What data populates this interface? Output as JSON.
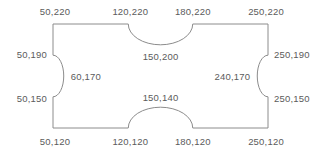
{
  "diagram": {
    "type": "coordinate-outline",
    "stroke_color": "#8c8c8c",
    "text_color": "#5b5b5b",
    "background_color": "#ffffff",
    "outline": {
      "rect_x_min": 50,
      "rect_x_max": 250,
      "rect_y_min": 120,
      "rect_y_max": 220
    },
    "labels": [
      {
        "id": "top-left-corner",
        "text": "50,220",
        "x": 50,
        "y": 220,
        "anchor": "center"
      },
      {
        "id": "top-notch-start",
        "text": "120,220",
        "x": 120,
        "y": 220,
        "anchor": "center"
      },
      {
        "id": "top-notch-end",
        "text": "180,220",
        "x": 180,
        "y": 220,
        "anchor": "center"
      },
      {
        "id": "top-right-corner",
        "text": "250,220",
        "x": 250,
        "y": 220,
        "anchor": "center"
      },
      {
        "id": "left-notch-start",
        "text": "50,190",
        "x": 50,
        "y": 190,
        "anchor": "right"
      },
      {
        "id": "right-notch-start",
        "text": "250,190",
        "x": 250,
        "y": 190,
        "anchor": "left"
      },
      {
        "id": "top-notch-apex",
        "text": "150,200",
        "x": 150,
        "y": 200,
        "anchor": "center"
      },
      {
        "id": "left-notch-apex",
        "text": "60,170",
        "x": 60,
        "y": 170,
        "anchor": "left"
      },
      {
        "id": "right-notch-apex",
        "text": "240,170",
        "x": 240,
        "y": 170,
        "anchor": "right"
      },
      {
        "id": "left-notch-end",
        "text": "50,150",
        "x": 50,
        "y": 150,
        "anchor": "right"
      },
      {
        "id": "right-notch-end",
        "text": "250,150",
        "x": 250,
        "y": 150,
        "anchor": "left"
      },
      {
        "id": "bottom-notch-apex",
        "text": "150,140",
        "x": 150,
        "y": 140,
        "anchor": "center"
      },
      {
        "id": "bottom-left-corner",
        "text": "50,120",
        "x": 50,
        "y": 120,
        "anchor": "center"
      },
      {
        "id": "bottom-notch-start",
        "text": "120,120",
        "x": 120,
        "y": 120,
        "anchor": "center"
      },
      {
        "id": "bottom-notch-end",
        "text": "180,120",
        "x": 180,
        "y": 120,
        "anchor": "center"
      },
      {
        "id": "bottom-right-corner",
        "text": "250,120",
        "x": 250,
        "y": 120,
        "anchor": "center"
      }
    ],
    "path_points": [
      {
        "id": "p-tl",
        "x": 50,
        "y": 220
      },
      {
        "id": "p-t1",
        "x": 120,
        "y": 220
      },
      {
        "id": "p-tarc",
        "x": 150,
        "y": 200
      },
      {
        "id": "p-t2",
        "x": 180,
        "y": 220
      },
      {
        "id": "p-tr",
        "x": 250,
        "y": 220
      },
      {
        "id": "p-r1",
        "x": 250,
        "y": 190
      },
      {
        "id": "p-rarc",
        "x": 240,
        "y": 170
      },
      {
        "id": "p-r2",
        "x": 250,
        "y": 150
      },
      {
        "id": "p-br",
        "x": 250,
        "y": 120
      },
      {
        "id": "p-b2",
        "x": 180,
        "y": 120
      },
      {
        "id": "p-barc",
        "x": 150,
        "y": 140
      },
      {
        "id": "p-b1",
        "x": 120,
        "y": 120
      },
      {
        "id": "p-bl",
        "x": 50,
        "y": 120
      },
      {
        "id": "p-l2",
        "x": 50,
        "y": 150
      },
      {
        "id": "p-larc",
        "x": 60,
        "y": 170
      },
      {
        "id": "p-l1",
        "x": 50,
        "y": 190
      }
    ]
  }
}
